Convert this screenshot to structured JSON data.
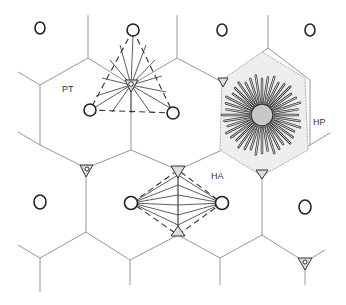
{
  "labels": {
    "portal_triangle": "PT",
    "hepatic_lobule": "HP",
    "hepatic_acinus": "HA"
  },
  "colors": {
    "grid": "#8a8a8a",
    "ink": "#222222",
    "central_vein_fill": "#c8c8c8",
    "stipple": "#b0b0b0"
  }
}
